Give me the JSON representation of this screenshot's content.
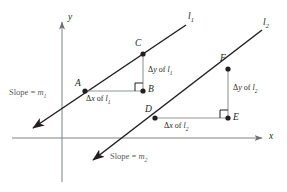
{
  "figure": {
    "name": "parallel-lines-slope-diagram",
    "width": 287,
    "height": 192,
    "background": "#ffffff",
    "stroke_color": "#231f20",
    "muted_text_color": "#58595b",
    "axis_color": "#808285",
    "leg_color": "#939598"
  },
  "axes": {
    "x_label": "x",
    "y_label": "y",
    "origin": {
      "x": 62,
      "y": 138
    }
  },
  "lines": [
    {
      "id": "l1",
      "label": "l",
      "label_sub": "1",
      "slope_text_prefix": "Slope = ",
      "slope_var": "m",
      "slope_sub": "1",
      "from": {
        "x": 33,
        "y": 128
      },
      "to": {
        "x": 186,
        "y": 25
      }
    },
    {
      "id": "l2",
      "label": "l",
      "label_sub": "2",
      "slope_text_prefix": "Slope = ",
      "slope_var": "m",
      "slope_sub": "2",
      "from": {
        "x": 93,
        "y": 160
      },
      "to": {
        "x": 262,
        "y": 30
      }
    }
  ],
  "points": [
    {
      "id": "A",
      "label": "A",
      "x": 85,
      "y": 91,
      "line": "l1"
    },
    {
      "id": "B",
      "label": "B",
      "x": 143,
      "y": 91,
      "line": "l1"
    },
    {
      "id": "C",
      "label": "C",
      "x": 143,
      "y": 54,
      "line": "l1"
    },
    {
      "id": "D",
      "label": "D",
      "x": 155,
      "y": 118,
      "line": "l2"
    },
    {
      "id": "E",
      "label": "E",
      "x": 228,
      "y": 118,
      "line": "l2"
    },
    {
      "id": "F",
      "label": "F",
      "x": 228,
      "y": 69,
      "line": "l2"
    }
  ],
  "annotations": {
    "dy_l1": {
      "delta": "Δ",
      "var": "y",
      "of": " of ",
      "line_var": "l",
      "line_sub": "1"
    },
    "dx_l1": {
      "delta": "Δ",
      "var": "x",
      "of": " of ",
      "line_var": "l",
      "line_sub": "1"
    },
    "dy_l2": {
      "delta": "Δ",
      "var": "y",
      "of": " of ",
      "line_var": "l",
      "line_sub": "2"
    },
    "dx_l2": {
      "delta": "Δ",
      "var": "x",
      "of": " of ",
      "line_var": "l",
      "line_sub": "2"
    }
  }
}
